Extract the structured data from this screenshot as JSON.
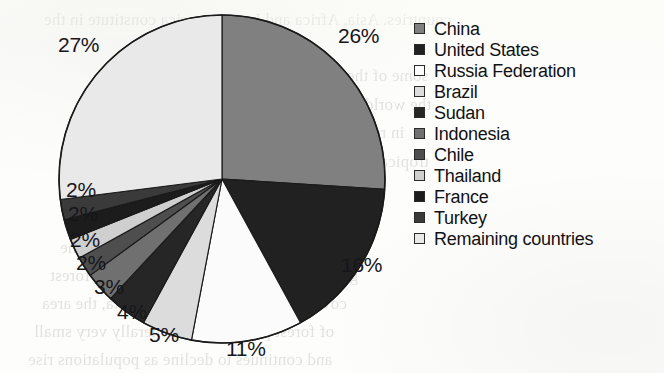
{
  "chart_data": {
    "type": "pie",
    "title": "",
    "subtitle": "",
    "xlabel": "",
    "ylabel": "",
    "legend_position": "right",
    "start_angle_deg": 0,
    "direction": "clockwise",
    "categories": [
      "China",
      "United States",
      "Russia Federation",
      "Brazil",
      "Sudan",
      "Indonesia",
      "Chile",
      "Thailand",
      "France",
      "Turkey",
      "Remaining countries"
    ],
    "values": [
      26,
      16,
      11,
      5,
      4,
      3,
      2,
      2,
      2,
      2,
      27
    ],
    "value_labels": [
      "26%",
      "16%",
      "11%",
      "5%",
      "4%",
      "3%",
      "2%",
      "2%",
      "2%",
      "2%",
      "27%"
    ],
    "colors": [
      "#808080",
      "#212121",
      "#fbfbfb",
      "#dcdcdc",
      "#262626",
      "#707070",
      "#4e4e4e",
      "#cfcfcf",
      "#1c1c1c",
      "#3a3a3a",
      "#e9e9e9"
    ],
    "slice_outline_color": "#1a1a1a",
    "units": "percent",
    "total": 100
  },
  "legend": {
    "items": [
      {
        "label": "China",
        "swatch": "#808080"
      },
      {
        "label": "United States",
        "swatch": "#212121"
      },
      {
        "label": "Russia Federation",
        "swatch": "#fbfbfb"
      },
      {
        "label": "Brazil",
        "swatch": "#dcdcdc"
      },
      {
        "label": "Sudan",
        "swatch": "#262626"
      },
      {
        "label": "Indonesia",
        "swatch": "#707070"
      },
      {
        "label": "Chile",
        "swatch": "#4e4e4e"
      },
      {
        "label": "Thailand",
        "swatch": "#cfcfcf"
      },
      {
        "label": "France",
        "swatch": "#1c1c1c"
      },
      {
        "label": "Turkey",
        "swatch": "#3a3a3a"
      },
      {
        "label": "Remaining countries",
        "swatch": "#e9e9e9"
      }
    ]
  },
  "pie_labels": [
    {
      "text": "26%",
      "x": 338,
      "y": 24
    },
    {
      "text": "16%",
      "x": 341,
      "y": 253
    },
    {
      "text": "11%",
      "x": 226,
      "y": 337
    },
    {
      "text": "5%",
      "x": 149,
      "y": 323
    },
    {
      "text": "4%",
      "x": 117,
      "y": 300
    },
    {
      "text": "3%",
      "x": 94,
      "y": 275
    },
    {
      "text": "2%",
      "x": 76,
      "y": 251
    },
    {
      "text": "2%",
      "x": 70,
      "y": 228
    },
    {
      "text": "2%",
      "x": 68,
      "y": 202
    },
    {
      "text": "2%",
      "x": 66,
      "y": 178
    },
    {
      "text": "27%",
      "x": 58,
      "y": 33
    }
  ],
  "background_text": {
    "lines": [
      {
        "text": "countries. Asia, Africa and Latin America constitute in the",
        "x": 44,
        "y": 10
      },
      {
        "text": "some of the largest remaining forest areas in",
        "x": 118,
        "y": 66
      },
      {
        "text": "the world. The rate of forest loss has declined",
        "x": 112,
        "y": 95
      },
      {
        "text": "in recent decades, but remains very high in",
        "x": 104,
        "y": 123
      },
      {
        "text": "tropical regions of the developing world, where",
        "x": 96,
        "y": 152
      },
      {
        "text": "the pressure of population growth and the",
        "x": 86,
        "y": 180
      },
      {
        "text": "demand for agricultural land and timber are",
        "x": 76,
        "y": 209
      },
      {
        "text": "the main drivers of deforestation across the",
        "x": 60,
        "y": 238
      },
      {
        "text": "globe. In those countries with a lower forest",
        "x": 50,
        "y": 266
      },
      {
        "text": "cover and lower income per capita, the area",
        "x": 42,
        "y": 294
      },
      {
        "text": "of forest per person is generally very small",
        "x": 34,
        "y": 322
      },
      {
        "text": "and continues to decline as populations rise",
        "x": 28,
        "y": 350
      }
    ]
  }
}
